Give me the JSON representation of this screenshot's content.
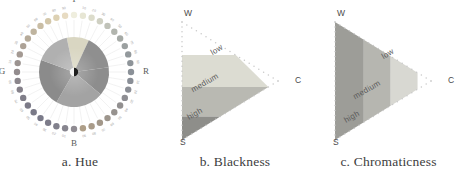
{
  "figure": {
    "panels": [
      {
        "id": "hue",
        "caption": "a. Hue",
        "type": "hue-wheel",
        "cardinal_labels": [
          {
            "label": "Y",
            "angle_deg": 270
          },
          {
            "label": "R",
            "angle_deg": 0
          },
          {
            "label": "B",
            "angle_deg": 90
          },
          {
            "label": "G",
            "angle_deg": 180
          }
        ],
        "wedges": [
          {
            "name": "yellow-wedge",
            "start_deg": 258,
            "end_deg": 295,
            "color": "#d9d6c2"
          },
          {
            "name": "orange-red-wedge",
            "start_deg": 295,
            "end_deg": 352,
            "color": "#8f8f8f"
          },
          {
            "name": "red-wedge",
            "start_deg": 352,
            "end_deg": 40,
            "color": "#8d8d8d"
          },
          {
            "name": "blue-purple-wedge",
            "start_deg": 40,
            "end_deg": 120,
            "color": "#a3a3a3"
          },
          {
            "name": "green-blue-wedge",
            "start_deg": 120,
            "end_deg": 200,
            "color": "#8b8b8b"
          },
          {
            "name": "green-yellow-wedge",
            "start_deg": 200,
            "end_deg": 258,
            "color": "#b0b0b0"
          }
        ],
        "center_dot": {
          "light": "#f2f2f2",
          "dark": "#1c1c1c"
        },
        "ring": {
          "count": 40,
          "note": "ring of colour swatch dots with small hue notation labels outside"
        }
      },
      {
        "id": "blackness",
        "caption": "b. Blackness",
        "type": "ncs-triangle",
        "vertices": {
          "top": "W",
          "bottom": "S",
          "right": "C"
        },
        "band_direction": "parallel-to-W-C-edge-horizontal-stack",
        "bands": [
          {
            "label": "low",
            "color": "#dcdcd2"
          },
          {
            "label": "medium",
            "color": "#b9b9b2"
          },
          {
            "label": "high",
            "color": "#8e8e8a"
          }
        ]
      },
      {
        "id": "chromaticness",
        "caption": "c. Chromaticness",
        "type": "ncs-triangle",
        "vertices": {
          "top": "W",
          "bottom": "S",
          "right": "C"
        },
        "band_direction": "parallel-to-W-S-edge-vertical-stack",
        "bands": [
          {
            "label": "low",
            "color": "#d8d8d2"
          },
          {
            "label": "medium",
            "color": "#b6b6b0"
          },
          {
            "label": "high",
            "color": "#9d9d98"
          }
        ]
      }
    ]
  }
}
